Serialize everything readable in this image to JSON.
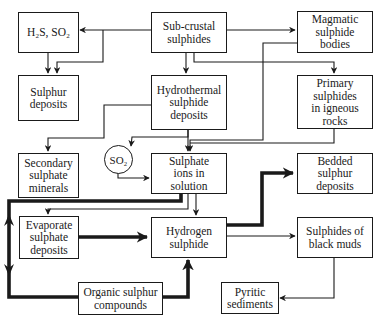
{
  "diagram": {
    "title": "",
    "nodes": {
      "h2s_so2": {
        "lines": [
          "H₂S,  SO₂"
        ]
      },
      "sub_crustal": {
        "lines": [
          "Sub-crustal",
          "sulphides"
        ]
      },
      "magmatic": {
        "lines": [
          "Magmatic",
          "sulphide",
          "bodies"
        ]
      },
      "sulphur_deposits": {
        "lines": [
          "Sulphur",
          "deposits"
        ]
      },
      "hydrothermal": {
        "lines": [
          "Hydrothermal",
          "sulphide",
          "deposits"
        ]
      },
      "primary": {
        "lines": [
          "Primary",
          "sulphides",
          "in igneous",
          "rocks"
        ]
      },
      "secondary": {
        "lines": [
          "Secondary",
          "sulphate",
          "minerals"
        ]
      },
      "so2_circle": {
        "label": "SO₂"
      },
      "sulphate_ions": {
        "lines": [
          "Sulphate",
          "ions in",
          "solution"
        ]
      },
      "bedded": {
        "lines": [
          "Bedded",
          "sulphur",
          "deposits"
        ]
      },
      "evaporate": {
        "lines": [
          "Evaporate",
          "sulphate",
          "deposits"
        ]
      },
      "hydrogen_sulphide": {
        "lines": [
          "Hydrogen",
          "sulphide"
        ]
      },
      "black_muds": {
        "lines": [
          "Sulphides of",
          "black muds"
        ]
      },
      "organic": {
        "lines": [
          "Organic sulphur",
          "compounds"
        ]
      },
      "pyritic": {
        "lines": [
          "Pyritic",
          "sediments"
        ]
      }
    },
    "edges": [
      {
        "from": "Sub-crustal sulphides",
        "to": "H₂S, SO₂",
        "weight": "thin"
      },
      {
        "from": "Sub-crustal sulphides",
        "to": "Sulphur deposits",
        "weight": "thin"
      },
      {
        "from": "Sub-crustal sulphides",
        "to": "Magmatic sulphide bodies",
        "weight": "thin"
      },
      {
        "from": "Sub-crustal sulphides",
        "to": "Hydrothermal sulphide deposits",
        "weight": "thin"
      },
      {
        "from": "Sub-crustal sulphides",
        "to": "Primary sulphides in igneous rocks",
        "weight": "thin"
      },
      {
        "from": "H₂S, SO₂",
        "to": "Sulphur deposits",
        "weight": "thin"
      },
      {
        "from": "Magmatic sulphide bodies",
        "to": "Sulphate ions in solution",
        "weight": "thin"
      },
      {
        "from": "Hydrothermal sulphide deposits",
        "to": "Secondary sulphate minerals",
        "weight": "thin"
      },
      {
        "from": "Hydrothermal sulphide deposits",
        "to": "SO₂",
        "weight": "thin"
      },
      {
        "from": "Hydrothermal sulphide deposits",
        "to": "Sulphate ions in solution",
        "weight": "thin"
      },
      {
        "from": "Primary sulphides in igneous rocks",
        "to": "Sulphate ions in solution",
        "weight": "thin"
      },
      {
        "from": "SO₂",
        "to": "Sulphate ions in solution",
        "weight": "thin"
      },
      {
        "from": "Sulphate ions in solution",
        "to": "Evaporate sulphate deposits",
        "weight": "thin"
      },
      {
        "from": "Sulphate ions in solution",
        "to": "Hydrogen sulphide",
        "weight": "thin"
      },
      {
        "from": "Sulphate ions in solution",
        "to": "Organic sulphur compounds",
        "weight": "thick",
        "bidirectional": true
      },
      {
        "from": "Evaporate sulphate deposits",
        "to": "Hydrogen sulphide",
        "weight": "thick"
      },
      {
        "from": "Organic sulphur compounds",
        "to": "Hydrogen sulphide",
        "weight": "thick"
      },
      {
        "from": "Hydrogen sulphide",
        "to": "Bedded sulphur deposits",
        "weight": "thick"
      },
      {
        "from": "Hydrogen sulphide",
        "to": "Sulphides of black muds",
        "weight": "thin"
      },
      {
        "from": "Sulphides of black muds",
        "to": "Pyritic sediments",
        "weight": "thin"
      }
    ]
  }
}
